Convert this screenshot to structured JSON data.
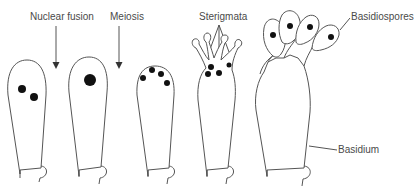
{
  "diagram": {
    "type": "biological-illustration",
    "colors": {
      "outline": "#555555",
      "nucleus": "#111111",
      "label": "#4a4a4a",
      "background": "#ffffff"
    },
    "labels": {
      "nuclear_fusion": "Nuclear fusion",
      "meiosis": "Meiosis",
      "sterigmata": "Sterigmata",
      "basidiospores": "Basidiospores",
      "basidium": "Basidium"
    },
    "stages": [
      {
        "id": "stage-1",
        "description": "Young basidium with two nuclei",
        "nuclei": 2
      },
      {
        "id": "stage-2",
        "description": "Nuclear fusion - single diploid nucleus",
        "nuclei": 1
      },
      {
        "id": "stage-3",
        "description": "Meiosis - four nuclei",
        "nuclei": 4
      },
      {
        "id": "stage-4",
        "description": "Sterigmata formation",
        "nuclei": 4
      },
      {
        "id": "stage-5",
        "description": "Mature basidium with basidiospores",
        "nuclei": 4
      }
    ]
  }
}
